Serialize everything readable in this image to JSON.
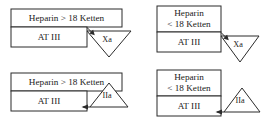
{
  "diagram": {
    "colors": {
      "background": "#ffffff",
      "stroke": "#2b2b2b",
      "text": "#1a1a1a",
      "shape_fill": "#ffffff"
    },
    "panels": [
      {
        "id": "top-left",
        "heparin_label": "Heparin > 18 Ketten",
        "heparin_line1": "Heparin > 18 Ketten",
        "heparin_line2": "",
        "at3_label": "AT III",
        "factor_label": "Xa",
        "triangle_direction": "down",
        "arrow_direction": "right-down"
      },
      {
        "id": "top-right",
        "heparin_label": "Heparin < 18 Ketten",
        "heparin_line1": "Heparin",
        "heparin_line2": "< 18 Ketten",
        "at3_label": "AT III",
        "factor_label": "Xa",
        "triangle_direction": "down",
        "arrow_direction": "right-down"
      },
      {
        "id": "bottom-left",
        "heparin_label": "Heparin > 18 Ketten",
        "heparin_line1": "Heparin > 18 Ketten",
        "heparin_line2": "",
        "at3_label": "AT III",
        "factor_label": "IIa",
        "triangle_direction": "up",
        "arrow_direction": "left"
      },
      {
        "id": "bottom-right",
        "heparin_label": "Heparin < 18 Ketten",
        "heparin_line1": "Heparin",
        "heparin_line2": "< 18 Ketten",
        "at3_label": "AT III",
        "factor_label": "IIa",
        "triangle_direction": "up",
        "arrow_direction": "left"
      }
    ]
  }
}
